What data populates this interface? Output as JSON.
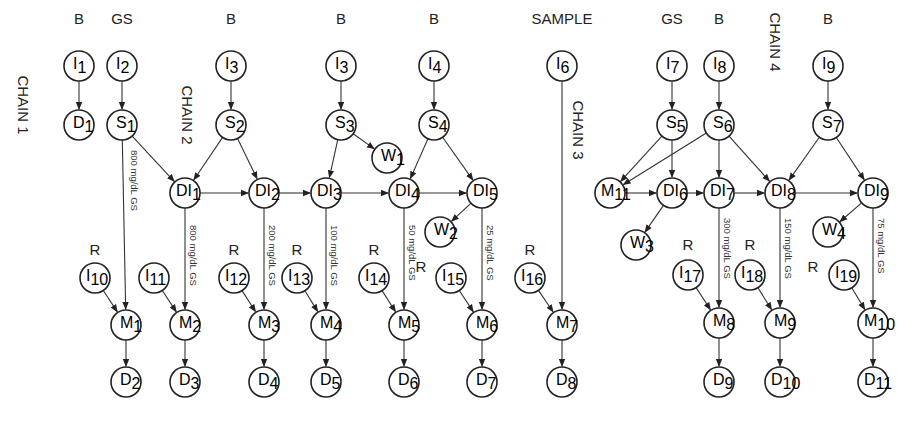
{
  "diagram": {
    "chains": [
      {
        "label": "CHAIN 1",
        "x": 18,
        "y": 105
      },
      {
        "label": "CHAIN 2",
        "x": 182,
        "y": 115
      },
      {
        "label": "CHAIN 3",
        "x": 573,
        "y": 130
      },
      {
        "label": "CHAIN 4",
        "x": 770,
        "y": 42
      }
    ],
    "top_labels": [
      {
        "text": "B",
        "x": 79,
        "y": 24
      },
      {
        "text": "GS",
        "x": 122,
        "y": 24
      },
      {
        "text": "B",
        "x": 231,
        "y": 24
      },
      {
        "text": "B",
        "x": 341,
        "y": 24
      },
      {
        "text": "B",
        "x": 434,
        "y": 24
      },
      {
        "text": "SAMPLE",
        "x": 562,
        "y": 24
      },
      {
        "text": "GS",
        "x": 672,
        "y": 24
      },
      {
        "text": "B",
        "x": 719,
        "y": 24
      },
      {
        "text": "B",
        "x": 828,
        "y": 24
      },
      {
        "text": "R",
        "x": 95,
        "y": 255
      },
      {
        "text": "R",
        "x": 234,
        "y": 255
      },
      {
        "text": "R",
        "x": 297,
        "y": 255
      },
      {
        "text": "R",
        "x": 374,
        "y": 255
      },
      {
        "text": "R",
        "x": 421,
        "y": 272
      },
      {
        "text": "R",
        "x": 530,
        "y": 255
      },
      {
        "text": "R",
        "x": 688,
        "y": 250
      },
      {
        "text": "R",
        "x": 750,
        "y": 250
      },
      {
        "text": "R",
        "x": 813,
        "y": 272
      }
    ],
    "nodes": [
      {
        "id": "I1",
        "base": "I",
        "sub": "1",
        "x": 79,
        "y": 66
      },
      {
        "id": "I2",
        "base": "I",
        "sub": "2",
        "x": 122,
        "y": 66
      },
      {
        "id": "I3a",
        "base": "I",
        "sub": "3",
        "x": 231,
        "y": 66
      },
      {
        "id": "I3b",
        "base": "I",
        "sub": "3",
        "x": 341,
        "y": 66
      },
      {
        "id": "I4",
        "base": "I",
        "sub": "4",
        "x": 434,
        "y": 66
      },
      {
        "id": "I6",
        "base": "I",
        "sub": "6",
        "x": 562,
        "y": 66
      },
      {
        "id": "I7",
        "base": "I",
        "sub": "7",
        "x": 672,
        "y": 66
      },
      {
        "id": "I8",
        "base": "I",
        "sub": "8",
        "x": 719,
        "y": 66
      },
      {
        "id": "I9",
        "base": "I",
        "sub": "9",
        "x": 828,
        "y": 66
      },
      {
        "id": "D1",
        "base": "D",
        "sub": "1",
        "x": 79,
        "y": 125
      },
      {
        "id": "S1",
        "base": "S",
        "sub": "1",
        "x": 122,
        "y": 125
      },
      {
        "id": "S2",
        "base": "S",
        "sub": "2",
        "x": 231,
        "y": 125
      },
      {
        "id": "S3",
        "base": "S",
        "sub": "3",
        "x": 341,
        "y": 125
      },
      {
        "id": "S4",
        "base": "S",
        "sub": "4",
        "x": 434,
        "y": 125
      },
      {
        "id": "S5",
        "base": "S",
        "sub": "5",
        "x": 672,
        "y": 125
      },
      {
        "id": "S6",
        "base": "S",
        "sub": "6",
        "x": 719,
        "y": 125
      },
      {
        "id": "S7",
        "base": "S",
        "sub": "7",
        "x": 828,
        "y": 125
      },
      {
        "id": "W1",
        "base": "W",
        "sub": "1",
        "x": 387,
        "y": 158
      },
      {
        "id": "DI1",
        "base": "DI",
        "sub": "1",
        "x": 185,
        "y": 193
      },
      {
        "id": "DI2",
        "base": "DI",
        "sub": "2",
        "x": 264,
        "y": 193
      },
      {
        "id": "DI3",
        "base": "DI",
        "sub": "3",
        "x": 326,
        "y": 193
      },
      {
        "id": "DI4",
        "base": "DI",
        "sub": "4",
        "x": 404,
        "y": 193
      },
      {
        "id": "DI5",
        "base": "DI",
        "sub": "5",
        "x": 482,
        "y": 193
      },
      {
        "id": "M11",
        "base": "M",
        "sub": "11",
        "x": 610,
        "y": 193
      },
      {
        "id": "DI6",
        "base": "DI",
        "sub": "6",
        "x": 672,
        "y": 193
      },
      {
        "id": "DI7",
        "base": "DI",
        "sub": "7",
        "x": 719,
        "y": 193
      },
      {
        "id": "DI8",
        "base": "DI",
        "sub": "8",
        "x": 780,
        "y": 193
      },
      {
        "id": "DI9",
        "base": "DI",
        "sub": "9",
        "x": 873,
        "y": 193
      },
      {
        "id": "W2",
        "base": "W",
        "sub": "2",
        "x": 440,
        "y": 232
      },
      {
        "id": "W3",
        "base": "W",
        "sub": "3",
        "x": 636,
        "y": 245
      },
      {
        "id": "W4",
        "base": "W",
        "sub": "4",
        "x": 828,
        "y": 232
      },
      {
        "id": "I10",
        "base": "I",
        "sub": "10",
        "x": 95,
        "y": 278
      },
      {
        "id": "I11",
        "base": "I",
        "sub": "11",
        "x": 154,
        "y": 278
      },
      {
        "id": "I12",
        "base": "I",
        "sub": "12",
        "x": 234,
        "y": 278
      },
      {
        "id": "I13",
        "base": "I",
        "sub": "13",
        "x": 297,
        "y": 278
      },
      {
        "id": "I14",
        "base": "I",
        "sub": "14",
        "x": 374,
        "y": 278
      },
      {
        "id": "I15",
        "base": "I",
        "sub": "15",
        "x": 451,
        "y": 278
      },
      {
        "id": "I16",
        "base": "I",
        "sub": "16",
        "x": 530,
        "y": 278
      },
      {
        "id": "I17",
        "base": "I",
        "sub": "17",
        "x": 688,
        "y": 275
      },
      {
        "id": "I18",
        "base": "I",
        "sub": "18",
        "x": 750,
        "y": 275
      },
      {
        "id": "I19",
        "base": "I",
        "sub": "19",
        "x": 844,
        "y": 275
      },
      {
        "id": "M1",
        "base": "M",
        "sub": "1",
        "x": 126,
        "y": 325
      },
      {
        "id": "M2",
        "base": "M",
        "sub": "2",
        "x": 185,
        "y": 325
      },
      {
        "id": "M3",
        "base": "M",
        "sub": "3",
        "x": 264,
        "y": 325
      },
      {
        "id": "M4",
        "base": "M",
        "sub": "4",
        "x": 326,
        "y": 325
      },
      {
        "id": "M5",
        "base": "M",
        "sub": "5",
        "x": 404,
        "y": 325
      },
      {
        "id": "M6",
        "base": "M",
        "sub": "6",
        "x": 482,
        "y": 325
      },
      {
        "id": "M7",
        "base": "M",
        "sub": "7",
        "x": 562,
        "y": 325
      },
      {
        "id": "M8",
        "base": "M",
        "sub": "8",
        "x": 719,
        "y": 323
      },
      {
        "id": "M9",
        "base": "M",
        "sub": "9",
        "x": 780,
        "y": 323
      },
      {
        "id": "M10",
        "base": "M",
        "sub": "10",
        "x": 873,
        "y": 323
      },
      {
        "id": "D2",
        "base": "D",
        "sub": "2",
        "x": 126,
        "y": 382
      },
      {
        "id": "D3",
        "base": "D",
        "sub": "3",
        "x": 185,
        "y": 382
      },
      {
        "id": "D4",
        "base": "D",
        "sub": "4",
        "x": 264,
        "y": 382
      },
      {
        "id": "D5",
        "base": "D",
        "sub": "5",
        "x": 326,
        "y": 382
      },
      {
        "id": "D6",
        "base": "D",
        "sub": "6",
        "x": 404,
        "y": 382
      },
      {
        "id": "D7",
        "base": "D",
        "sub": "7",
        "x": 482,
        "y": 382
      },
      {
        "id": "D8",
        "base": "D",
        "sub": "8",
        "x": 562,
        "y": 382
      },
      {
        "id": "D9",
        "base": "D",
        "sub": "9",
        "x": 719,
        "y": 382
      },
      {
        "id": "D10",
        "base": "D",
        "sub": "10",
        "x": 780,
        "y": 382
      },
      {
        "id": "D11",
        "base": "D",
        "sub": "11",
        "x": 873,
        "y": 382
      }
    ],
    "edges": [
      [
        "I1",
        "D1"
      ],
      [
        "I2",
        "S1"
      ],
      [
        "I3a",
        "S2"
      ],
      [
        "I3b",
        "S3"
      ],
      [
        "I4",
        "S4"
      ],
      [
        "I7",
        "S5"
      ],
      [
        "I8",
        "S6"
      ],
      [
        "I9",
        "S7"
      ],
      [
        "I6",
        "M7"
      ],
      [
        "S1",
        "DI1"
      ],
      [
        "S2",
        "DI1"
      ],
      [
        "S2",
        "DI2"
      ],
      [
        "S3",
        "DI3"
      ],
      [
        "S3",
        "W1"
      ],
      [
        "S4",
        "DI4"
      ],
      [
        "S4",
        "DI5"
      ],
      [
        "DI1",
        "DI2"
      ],
      [
        "DI2",
        "DI3"
      ],
      [
        "DI3",
        "DI4"
      ],
      [
        "DI4",
        "DI5"
      ],
      [
        "DI5",
        "W2"
      ],
      [
        "S5",
        "M11"
      ],
      [
        "S6",
        "M11"
      ],
      [
        "S5",
        "DI6"
      ],
      [
        "S6",
        "DI7"
      ],
      [
        "S6",
        "DI8"
      ],
      [
        "S7",
        "DI8"
      ],
      [
        "S7",
        "DI9"
      ],
      [
        "M11",
        "DI6"
      ],
      [
        "DI6",
        "DI7"
      ],
      [
        "DI7",
        "DI8"
      ],
      [
        "DI8",
        "DI9"
      ],
      [
        "DI6",
        "W3"
      ],
      [
        "DI9",
        "W4"
      ],
      [
        "S1",
        "M1"
      ],
      [
        "DI1",
        "M2"
      ],
      [
        "DI2",
        "M3"
      ],
      [
        "DI3",
        "M4"
      ],
      [
        "DI4",
        "M5"
      ],
      [
        "DI5",
        "M6"
      ],
      [
        "DI7",
        "M8"
      ],
      [
        "DI8",
        "M9"
      ],
      [
        "DI9",
        "M10"
      ],
      [
        "I10",
        "M1"
      ],
      [
        "I11",
        "M2"
      ],
      [
        "I12",
        "M3"
      ],
      [
        "I13",
        "M4"
      ],
      [
        "I14",
        "M5"
      ],
      [
        "I15",
        "M6"
      ],
      [
        "I16",
        "M7"
      ],
      [
        "I17",
        "M8"
      ],
      [
        "I18",
        "M9"
      ],
      [
        "I19",
        "M10"
      ],
      [
        "M1",
        "D2"
      ],
      [
        "M2",
        "D3"
      ],
      [
        "M3",
        "D4"
      ],
      [
        "M4",
        "D5"
      ],
      [
        "M5",
        "D6"
      ],
      [
        "M6",
        "D7"
      ],
      [
        "M7",
        "D8"
      ],
      [
        "M8",
        "D9"
      ],
      [
        "M9",
        "D10"
      ],
      [
        "M10",
        "D11"
      ]
    ],
    "concentration_labels": [
      {
        "text": "800 mg/dL GS",
        "x": 131,
        "y": 150
      },
      {
        "text": "800 mg/dL GS",
        "x": 190,
        "y": 225
      },
      {
        "text": "200 mg/dL GS",
        "x": 269,
        "y": 225
      },
      {
        "text": "100 mg/dL GS",
        "x": 331,
        "y": 225
      },
      {
        "text": "50 mg/dL GS",
        "x": 409,
        "y": 225
      },
      {
        "text": "25 mg/dL GS",
        "x": 487,
        "y": 225
      },
      {
        "text": "300 mg/dL GS",
        "x": 724,
        "y": 218
      },
      {
        "text": "150 mg/dL GS",
        "x": 785,
        "y": 218
      },
      {
        "text": "75 mg/dL GS",
        "x": 878,
        "y": 218
      }
    ]
  }
}
